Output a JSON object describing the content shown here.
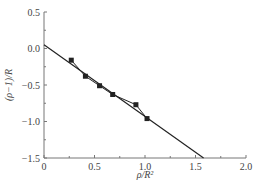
{
  "chart_data": {
    "type": "scatter",
    "title": "",
    "xlabel": "ρ/R²",
    "ylabel": "(ρ−1)/R",
    "xlim": [
      0,
      2.0
    ],
    "ylim": [
      -1.5,
      0.5
    ],
    "x_ticks": [
      0,
      0.5,
      1.0,
      1.5,
      2.0
    ],
    "x_tick_labels": [
      "0",
      "0.5",
      "1.0",
      "1.5",
      "2.0"
    ],
    "x_minor_ticks": [
      0.25,
      0.75,
      1.25,
      1.75
    ],
    "y_ticks": [
      0.5,
      0.0,
      -0.5,
      -1.0,
      -1.5
    ],
    "y_tick_labels": [
      "0.5",
      "0.0",
      "−0.5",
      "−1.0",
      "−1.5"
    ],
    "y_minor_ticks": [
      0.25,
      -0.25,
      -0.75,
      -1.25
    ],
    "grid": false,
    "legend": null,
    "series": [
      {
        "name": "data",
        "style": "square markers connected by line",
        "x": [
          0.27,
          0.41,
          0.55,
          0.68,
          0.91,
          1.02
        ],
        "y": [
          -0.16,
          -0.38,
          -0.51,
          -0.63,
          -0.77,
          -0.96
        ]
      },
      {
        "name": "linear fit",
        "style": "straight line",
        "x": [
          0,
          1.58
        ],
        "y": [
          0.05,
          -1.5
        ]
      }
    ]
  },
  "colors": {
    "axis": "#777777",
    "line": "#222222",
    "marker": "#222222",
    "text": "#444444"
  }
}
